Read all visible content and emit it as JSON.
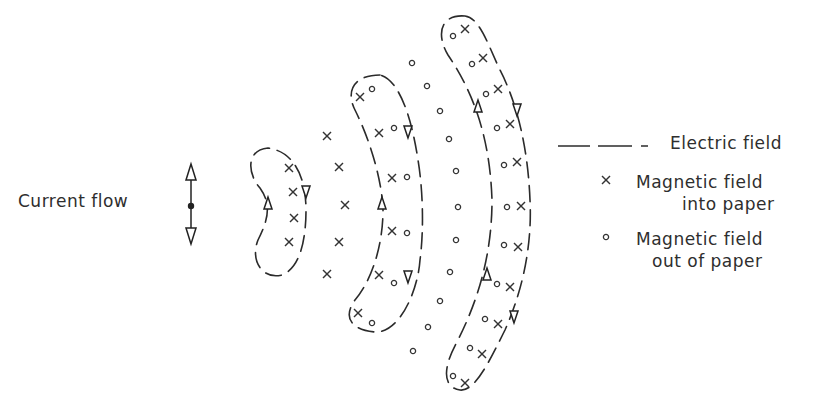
{
  "diagram": {
    "type": "electromagnetic field pattern around an oscillating dipole",
    "source_label": "Current flow",
    "legend": [
      {
        "symbol": "dashed-line",
        "label": "Electric field"
      },
      {
        "symbol": "x",
        "label_line1": "Magnetic field",
        "label_line2": "into paper"
      },
      {
        "symbol": "o",
        "label_line1": "Magnetic field",
        "label_line2": "out of paper"
      }
    ],
    "colors": {
      "ink": "#2b2b2b",
      "background": "#ffffff"
    },
    "loops": [
      {
        "name": "inner-loop",
        "flow": "up-left / down-right"
      },
      {
        "name": "middle-loop",
        "flow": "up-left / down-right"
      },
      {
        "name": "outer-loop",
        "flow": "up-left / down-right"
      }
    ]
  }
}
